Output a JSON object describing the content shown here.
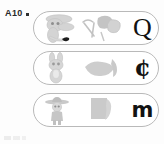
{
  "page": {
    "item_label": "A10",
    "bullet": "square-bullet",
    "background_color": "#fdfdfd",
    "ink_color": "#121212",
    "capsule_border_color": "#b9b9b9",
    "artwork_gray": "#c9c9c9"
  },
  "rows": [
    {
      "id": "row-q",
      "figure": {
        "name": "cartoon-animal-figure",
        "description": "faint gray cartoon character facing right"
      },
      "object": {
        "name": "tools-and-block-shapes",
        "description": "faint gray tool shape beside a gray block"
      },
      "letter": {
        "glyph": "Q",
        "style": "serif-capital"
      }
    },
    {
      "id": "row-c",
      "figure": {
        "name": "cartoon-rabbit-figure",
        "description": "faint gray cartoon figure with two ears"
      },
      "object": {
        "name": "gray-blob-and-leaf-shape",
        "description": "faint gray blob shape with pointed form"
      },
      "letter": {
        "glyph": "¢",
        "style": "blackletter-capital-c"
      }
    },
    {
      "id": "row-m",
      "figure": {
        "name": "cartoon-person-with-hat",
        "description": "faint gray figure wearing a wide brimmed hat"
      },
      "object": {
        "name": "gray-rectangle-shape",
        "description": "faint gray upright rectangular block"
      },
      "letter": {
        "glyph": "m",
        "style": "sans-bold-lowercase"
      }
    }
  ]
}
